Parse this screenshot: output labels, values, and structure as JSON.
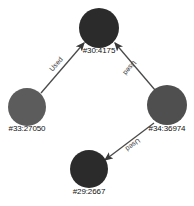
{
  "diagram": {
    "type": "directed-graph",
    "background_color": "#ffffff",
    "nodes": [
      {
        "id": "n30",
        "label": "#30:4175",
        "color": "#2b2b2b",
        "cx": 99,
        "cy": 28,
        "r": 20,
        "label_x": 99,
        "label_y": 46
      },
      {
        "id": "n33",
        "label": "#33:27050",
        "color": "#5c5c5c",
        "cx": 27,
        "cy": 107,
        "r": 19,
        "label_x": 27,
        "label_y": 124
      },
      {
        "id": "n34",
        "label": "#34:36974",
        "color": "#4f4f4f",
        "cx": 167,
        "cy": 105,
        "r": 20,
        "label_x": 167,
        "label_y": 124
      },
      {
        "id": "n29",
        "label": "#29:2667",
        "color": "#2b2b2b",
        "cx": 89,
        "cy": 169,
        "r": 19,
        "label_x": 89,
        "label_y": 187
      }
    ],
    "edges": [
      {
        "id": "e1",
        "from": "n33",
        "to": "n30",
        "label": "Used",
        "color": "#4a4a4a",
        "x1": 41,
        "y1": 93,
        "x2": 84,
        "y2": 43,
        "label_x": 56,
        "label_y": 64,
        "label_rotation": -49
      },
      {
        "id": "e2",
        "from": "n34",
        "to": "n30",
        "label": "Used",
        "color": "#4a4a4a",
        "x1": 155,
        "y1": 90,
        "x2": 115,
        "y2": 43,
        "label_x": 130,
        "label_y": 68,
        "label_rotation": 130
      },
      {
        "id": "e3",
        "from": "n34",
        "to": "n29",
        "label": "Used",
        "color": "#4a4a4a",
        "x1": 154,
        "y1": 123,
        "x2": 105,
        "y2": 160,
        "label_x": 133,
        "label_y": 145,
        "label_rotation": 143
      }
    ],
    "arrow": {
      "name": "arrowhead",
      "color": "#3a3a3a",
      "size": 6
    }
  }
}
